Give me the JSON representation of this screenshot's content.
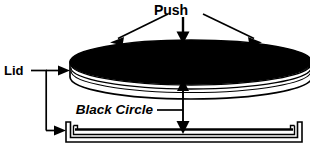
{
  "figure": {
    "type": "technical-illustration",
    "background_color": "#ffffff",
    "ink_color": "#000000",
    "labels": {
      "push": "Push",
      "lid": "Lid",
      "black_circle": "Black Circle"
    },
    "parts": [
      {
        "name": "black-circle-top",
        "label": "Black Circle",
        "fill": "#000000",
        "shape": "ellipse"
      },
      {
        "name": "lid-disc",
        "label": "Lid",
        "fill": "#ffffff",
        "shape": "cylinder"
      },
      {
        "name": "tray-base",
        "label": "Lid",
        "fill": "#ffffff",
        "shape": "shallow-tray"
      }
    ],
    "annotations": [
      {
        "name": "push-arrow-left",
        "direction": "down-left",
        "points_to": "lid-disc"
      },
      {
        "name": "push-arrow-center",
        "direction": "down",
        "points_to": "lid-disc"
      },
      {
        "name": "push-arrow-right",
        "direction": "down-right",
        "points_to": "lid-disc"
      },
      {
        "name": "lid-bracket-arrow-upper",
        "direction": "right",
        "points_to": "lid-disc"
      },
      {
        "name": "lid-bracket-arrow-lower",
        "direction": "right",
        "points_to": "tray-base"
      },
      {
        "name": "black-circle-dimension-arrow",
        "direction": "double-vertical",
        "points_to": "gap-between-lid-and-tray"
      }
    ]
  }
}
